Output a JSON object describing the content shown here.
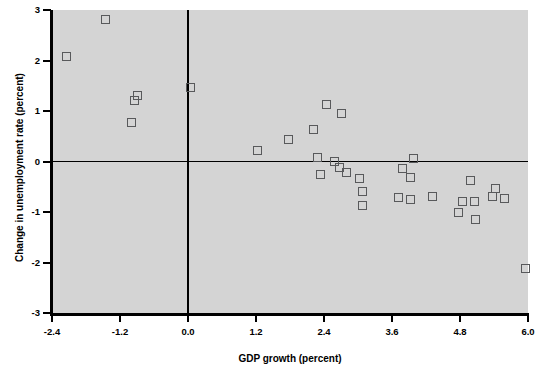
{
  "chart_data": {
    "type": "scatter",
    "title": "",
    "xlabel": "GDP growth (percent)",
    "ylabel": "Change in unemployment rate (percent)",
    "xlim": [
      -2.4,
      6.0
    ],
    "ylim": [
      -3,
      3
    ],
    "xticks": [
      "-2.4",
      "-1.2",
      "0.0",
      "1.2",
      "2.4",
      "3.6",
      "4.8",
      "6.0"
    ],
    "xtick_values": [
      -2.4,
      -1.2,
      0.0,
      1.2,
      2.4,
      3.6,
      4.8,
      6.0
    ],
    "yticks": [
      "3",
      "2",
      "1",
      "0",
      "-1",
      "-2",
      "-3"
    ],
    "ytick_values": [
      3,
      2,
      1,
      0,
      -1,
      -2,
      -3
    ],
    "grid": false,
    "legend": null,
    "marker": "open-square",
    "marker_color": "#58595b",
    "plot_background": "#d4d4d4",
    "axis_color": "#000000",
    "zero_lines": {
      "horizontal_y": 0,
      "vertical_x": 0.0
    },
    "points": [
      {
        "x": -2.15,
        "y": 2.07
      },
      {
        "x": -1.45,
        "y": 2.82
      },
      {
        "x": -0.9,
        "y": 1.3
      },
      {
        "x": -0.95,
        "y": 1.21
      },
      {
        "x": -1.0,
        "y": 0.77
      },
      {
        "x": 0.05,
        "y": 1.47
      },
      {
        "x": 1.22,
        "y": 0.22
      },
      {
        "x": 1.78,
        "y": 0.44
      },
      {
        "x": 2.22,
        "y": 0.64
      },
      {
        "x": 2.45,
        "y": 1.12
      },
      {
        "x": 2.7,
        "y": 0.96
      },
      {
        "x": 2.28,
        "y": 0.07
      },
      {
        "x": 2.33,
        "y": -0.26
      },
      {
        "x": 2.58,
        "y": 0.0
      },
      {
        "x": 2.68,
        "y": -0.11
      },
      {
        "x": 2.8,
        "y": -0.21
      },
      {
        "x": 3.02,
        "y": -0.34
      },
      {
        "x": 3.08,
        "y": -0.6
      },
      {
        "x": 3.08,
        "y": -0.87
      },
      {
        "x": 3.78,
        "y": -0.13
      },
      {
        "x": 3.98,
        "y": 0.06
      },
      {
        "x": 3.92,
        "y": -0.32
      },
      {
        "x": 3.72,
        "y": -0.72
      },
      {
        "x": 3.92,
        "y": -0.76
      },
      {
        "x": 4.32,
        "y": -0.7
      },
      {
        "x": 4.78,
        "y": -1.01
      },
      {
        "x": 4.85,
        "y": -0.8
      },
      {
        "x": 4.98,
        "y": -0.37
      },
      {
        "x": 5.05,
        "y": -0.79
      },
      {
        "x": 5.08,
        "y": -1.14
      },
      {
        "x": 5.42,
        "y": -0.54
      },
      {
        "x": 5.38,
        "y": -0.69
      },
      {
        "x": 5.58,
        "y": -0.73
      },
      {
        "x": 5.95,
        "y": -2.11
      }
    ]
  }
}
